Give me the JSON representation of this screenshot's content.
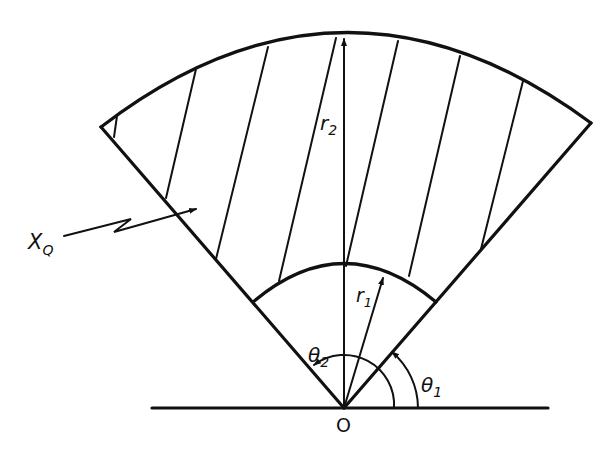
{
  "diagram": {
    "labels": {
      "outer_radius": "r",
      "outer_radius_sub": "2",
      "inner_radius": "r",
      "inner_radius_sub": "1",
      "angle_start": "θ",
      "angle_start_sub": "1",
      "angle_end": "θ",
      "angle_end_sub": "2",
      "origin": "O",
      "radiation": "X",
      "radiation_sub": "Q"
    },
    "geometry_degrees": {
      "theta1": 50,
      "theta2": 130
    },
    "hatch_line_count": 7,
    "colors": {
      "ink": "#111111",
      "background": "#ffffff"
    }
  }
}
